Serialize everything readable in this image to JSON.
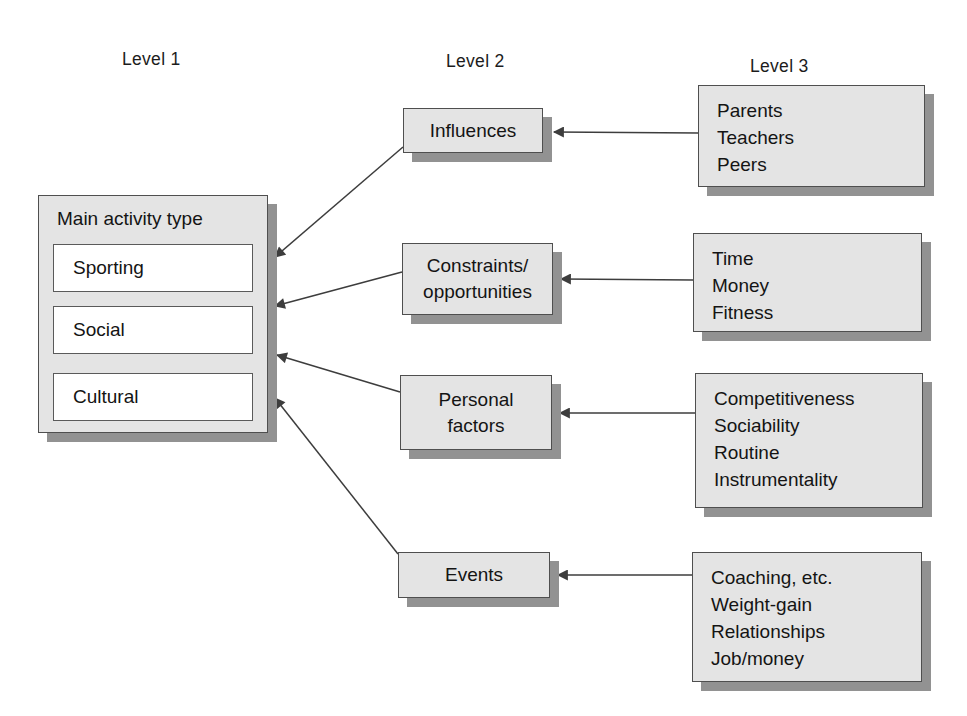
{
  "figure": {
    "type": "hierarchy-diagram",
    "columns": {
      "level1": "Level 1",
      "level2": "Level 2",
      "level3": "Level 3"
    }
  },
  "level1": {
    "title": "Main activity type",
    "items": [
      "Sporting",
      "Social",
      "Cultural"
    ]
  },
  "level2": {
    "boxes": [
      {
        "id": "influences",
        "lines": [
          "Influences"
        ]
      },
      {
        "id": "constraints-opportunities",
        "lines": [
          "Constraints/",
          "opportunities"
        ]
      },
      {
        "id": "personal-factors",
        "lines": [
          "Personal",
          "factors"
        ]
      },
      {
        "id": "events",
        "lines": [
          "Events"
        ]
      }
    ]
  },
  "level3": {
    "boxes": [
      {
        "id": "influences-items",
        "items": [
          "Parents",
          "Teachers",
          "Peers"
        ]
      },
      {
        "id": "constraints-items",
        "items": [
          "Time",
          "Money",
          "Fitness"
        ]
      },
      {
        "id": "personal-items",
        "items": [
          "Competitiveness",
          "Sociability",
          "Routine",
          "Instrumentality"
        ]
      },
      {
        "id": "events-items",
        "items": [
          "Coaching, etc.",
          "Weight-gain",
          "Relationships",
          "Job/money"
        ]
      }
    ]
  },
  "edges": [
    {
      "from": "influences-items",
      "to": "influences"
    },
    {
      "from": "constraints-items",
      "to": "constraints-opportunities"
    },
    {
      "from": "personal-items",
      "to": "personal-factors"
    },
    {
      "from": "events-items",
      "to": "events"
    },
    {
      "from": "influences",
      "to": "main-activity-type"
    },
    {
      "from": "constraints-opportunities",
      "to": "main-activity-type"
    },
    {
      "from": "personal-factors",
      "to": "main-activity-type"
    },
    {
      "from": "events",
      "to": "main-activity-type"
    }
  ],
  "colors": {
    "box_fill": "#e4e4e4",
    "box_border": "#4f4f4f",
    "box_shadow": "#929292",
    "item_fill": "#ffffff",
    "arrow": "#3d3d3d",
    "background": "#ffffff",
    "text": "#141414"
  }
}
